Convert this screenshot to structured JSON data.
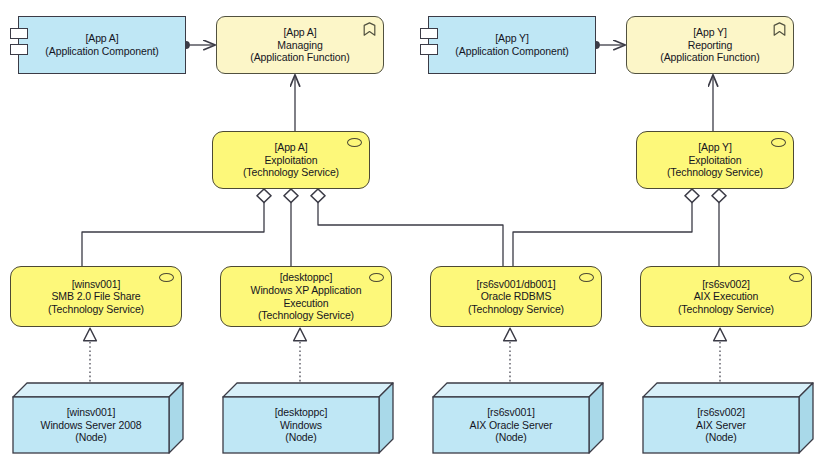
{
  "diagram": {
    "colors": {
      "application_component_fill": "#bfe7f5",
      "application_function_fill": "#fcf6c8",
      "technology_service_fill": "#fdf87a",
      "node_fill": "#bfe7f5",
      "node_top_fill": "#d8f0f9",
      "node_side_fill": "#a9d9e9",
      "stroke": "#3b3b46",
      "background": "#ffffff"
    }
  },
  "elements": {
    "app_a_component": {
      "id_line": "[App A]",
      "type_line": "(Application Component)",
      "icon": "uml-component-icon",
      "x": 18,
      "y": 16,
      "w": 168,
      "h": 58
    },
    "app_a_managing": {
      "id_line": "[App A]",
      "name_line": "Managing",
      "type_line": "(Application Function)",
      "icon": "application-function-icon",
      "x": 216,
      "y": 16,
      "w": 168,
      "h": 58
    },
    "app_y_component": {
      "id_line": "[App Y]",
      "type_line": "(Application Component)",
      "icon": "uml-component-icon",
      "x": 428,
      "y": 16,
      "w": 168,
      "h": 58
    },
    "app_y_reporting": {
      "id_line": "[App Y]",
      "name_line": "Reporting",
      "type_line": "(Application Function)",
      "icon": "application-function-icon",
      "x": 626,
      "y": 16,
      "w": 168,
      "h": 58
    },
    "app_a_exploitation": {
      "id_line": "[App A]",
      "name_line": "Exploitation",
      "type_line": "(Technology Service)",
      "icon": "technology-service-icon",
      "x": 212,
      "y": 131,
      "w": 158,
      "h": 58
    },
    "app_y_exploitation": {
      "id_line": "[App Y]",
      "name_line": "Exploitation",
      "type_line": "(Technology Service)",
      "icon": "technology-service-icon",
      "x": 636,
      "y": 131,
      "w": 158,
      "h": 58
    },
    "svc_smb": {
      "id_line": "[winsv001]",
      "name_line": "SMB 2.0 File Share",
      "type_line": "(Technology Service)",
      "icon": "technology-service-icon",
      "x": 10,
      "y": 266,
      "w": 172,
      "h": 61
    },
    "svc_winxp": {
      "id_line": "[desktoppc]",
      "name_line": "Windows XP Application",
      "name_line_2": "Execution",
      "type_line": "(Technology Service)",
      "icon": "technology-service-icon",
      "x": 220,
      "y": 266,
      "w": 172,
      "h": 61
    },
    "svc_oracle": {
      "id_line": "[rs6sv001/db001]",
      "name_line": "Oracle RDBMS",
      "type_line": "(Technology Service)",
      "icon": "technology-service-icon",
      "x": 430,
      "y": 266,
      "w": 172,
      "h": 61
    },
    "svc_aix": {
      "id_line": "[rs6sv002]",
      "name_line": "AIX Execution",
      "type_line": "(Technology Service)",
      "icon": "technology-service-icon",
      "x": 640,
      "y": 266,
      "w": 172,
      "h": 61
    },
    "node_winsv001": {
      "id_line": "[winsv001]",
      "name_line": "Windows Server 2008",
      "type_line": "(Node)",
      "icon": "node-3d-box-icon",
      "x": 12,
      "y": 382,
      "w": 172,
      "h": 72
    },
    "node_desktoppc": {
      "id_line": "[desktoppc]",
      "name_line": "Windows",
      "type_line": "(Node)",
      "icon": "node-3d-box-icon",
      "x": 222,
      "y": 382,
      "w": 172,
      "h": 72
    },
    "node_rs6sv001": {
      "id_line": "[rs6sv001]",
      "name_line": "AIX Oracle Server",
      "type_line": "(Node)",
      "icon": "node-3d-box-icon",
      "x": 432,
      "y": 382,
      "w": 172,
      "h": 72
    },
    "node_rs6sv002": {
      "id_line": "[rs6sv002]",
      "name_line": "AIX Server",
      "type_line": "(Node)",
      "icon": "node-3d-box-icon",
      "x": 642,
      "y": 382,
      "w": 172,
      "h": 72
    }
  },
  "relationships": [
    {
      "name": "assignment-app-a-component-to-managing",
      "kind": "assignment",
      "from": "app_a_component",
      "to": "app_a_managing"
    },
    {
      "name": "assignment-app-y-component-to-reporting",
      "kind": "assignment",
      "from": "app_y_component",
      "to": "app_y_reporting"
    },
    {
      "name": "serving-app-a-exploitation-to-managing",
      "kind": "serving",
      "from": "app_a_exploitation",
      "to": "app_a_managing"
    },
    {
      "name": "serving-app-y-exploitation-to-reporting",
      "kind": "serving",
      "from": "app_y_exploitation",
      "to": "app_y_reporting"
    },
    {
      "name": "aggregation-app-a-exploitation-to-smb",
      "kind": "aggregation",
      "from": "app_a_exploitation",
      "to": "svc_smb"
    },
    {
      "name": "aggregation-app-a-exploitation-to-winxp",
      "kind": "aggregation",
      "from": "app_a_exploitation",
      "to": "svc_winxp"
    },
    {
      "name": "aggregation-app-a-exploitation-to-oracle",
      "kind": "aggregation",
      "from": "app_a_exploitation",
      "to": "svc_oracle"
    },
    {
      "name": "aggregation-app-y-exploitation-to-oracle",
      "kind": "aggregation",
      "from": "app_y_exploitation",
      "to": "svc_oracle"
    },
    {
      "name": "aggregation-app-y-exploitation-to-aix",
      "kind": "aggregation",
      "from": "app_y_exploitation",
      "to": "svc_aix"
    },
    {
      "name": "realization-winsv001-to-smb",
      "kind": "realization",
      "from": "node_winsv001",
      "to": "svc_smb"
    },
    {
      "name": "realization-desktoppc-to-winxp",
      "kind": "realization",
      "from": "node_desktoppc",
      "to": "svc_winxp"
    },
    {
      "name": "realization-rs6sv001-to-oracle",
      "kind": "realization",
      "from": "node_rs6sv001",
      "to": "svc_oracle"
    },
    {
      "name": "realization-rs6sv002-to-aix",
      "kind": "realization",
      "from": "node_rs6sv002",
      "to": "svc_aix"
    }
  ]
}
